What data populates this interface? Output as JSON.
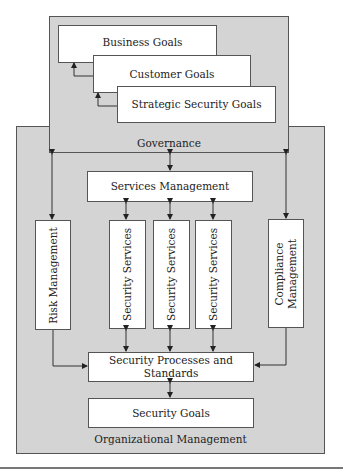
{
  "diagram": {
    "organizational_management": {
      "label": "Organizational Management"
    },
    "governance": {
      "label": "Governance"
    },
    "goals": {
      "business": "Business Goals",
      "customer": "Customer Goals",
      "strategic": "Strategic Security Goals"
    },
    "services_management": "Services Management",
    "risk_management": "Risk Management",
    "security_services": [
      "Security Services",
      "Security Services",
      "Security Services"
    ],
    "compliance_management": "Compliance Management",
    "security_processes": "Security Processes and Standards",
    "security_goals": "Security Goals",
    "colors": {
      "panel_fill": "#d4d4d4",
      "box_fill": "#ffffff",
      "stroke": "#555555"
    }
  }
}
